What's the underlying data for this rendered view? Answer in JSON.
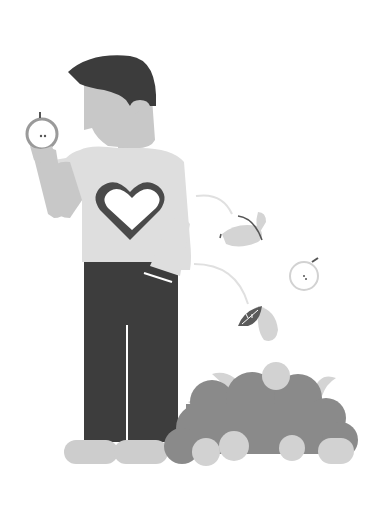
{
  "illustration": {
    "description": "Man holding an apple, wearing a heart t-shirt, with a pile of leaves and apples",
    "colors": {
      "background": "#ffffff",
      "skin": "#c8c8c8",
      "hair": "#3c3c3c",
      "shirt": "#dedede",
      "heart_outline": "#4a4a4a",
      "heart_fill": "#ffffff",
      "pants": "#3d3d3d",
      "shoes": "#cdcdcd",
      "pile_dark": "#8a8a8a",
      "pile_light": "#d2d2d2",
      "leaf_light": "#d4d4d4",
      "leaf_dark": "#5a5a5a",
      "trail": "#e0e0e0",
      "apple_outline": "#9a9a9a",
      "stem": "#555555"
    },
    "elements": [
      "man",
      "apple-in-hand",
      "heart-shirt",
      "falling-leaf",
      "falling-apple",
      "leaf-pile",
      "apples-on-ground"
    ]
  }
}
